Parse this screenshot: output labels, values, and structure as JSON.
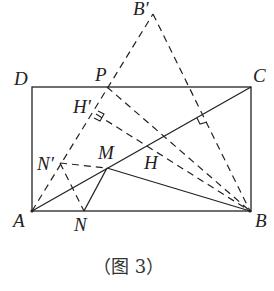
{
  "figure": {
    "caption": "（图 3）",
    "points": {
      "A": "A",
      "B": "B",
      "C": "C",
      "D": "D",
      "P": "P",
      "B_prime": "B′",
      "H_prime": "H′",
      "H": "H",
      "M": "M",
      "N": "N",
      "N_prime": "N′"
    },
    "stroke_color": "#222222"
  }
}
